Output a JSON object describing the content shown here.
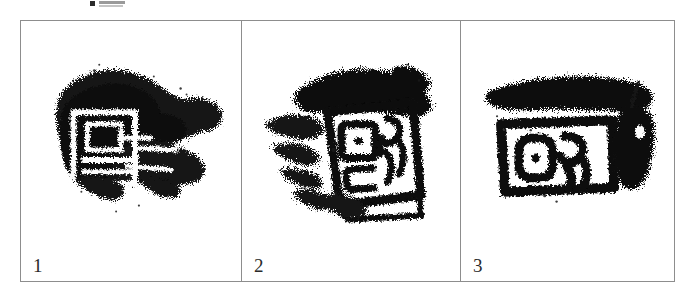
{
  "figure": {
    "caption_fragment_top": "",
    "caption_fragment_bottom": "",
    "border_color": "#8d8d8d",
    "ink_color": "#111111",
    "background_color": "#ffffff",
    "panels": [
      {
        "number": "1",
        "subject": "ink-rubbing-of-ancient-chinese-seal-impression",
        "description": "heavily inked irregular rubbing with a squarish seal character at left and dense smudged ink spreading to the right"
      },
      {
        "number": "2",
        "subject": "ink-rubbing-of-ancient-chinese-seal-impression",
        "description": "rubbing showing a tilted rectangular seal border enclosing a two-part seal-script character, with dense ink along the top edge"
      },
      {
        "number": "3",
        "subject": "ink-rubbing-of-ancient-chinese-seal-impression",
        "description": "rubbing showing a horizontal rectangular seal border enclosing a seal-script character, heavy ink band across the top and a dark vertical mass at the right"
      }
    ]
  }
}
